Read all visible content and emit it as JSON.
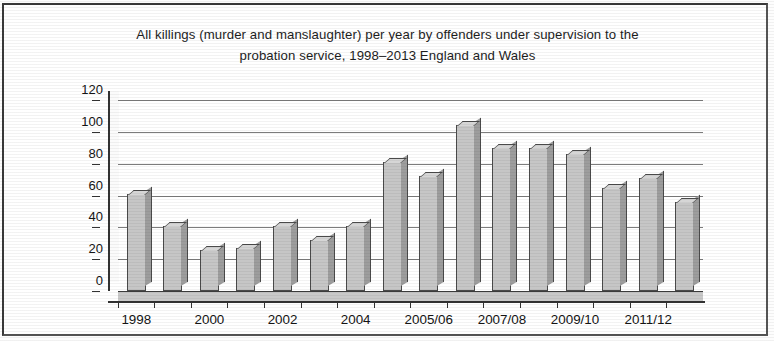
{
  "figure": {
    "title_line1": "All killings (murder and manslaughter) per year by offenders under supervision to the",
    "title_line2": "probation service, 1998–2013 England and Wales"
  },
  "chart_data": {
    "type": "bar",
    "title": "All killings (murder and manslaughter) per year by offenders under supervision to the probation service, 1998–2013 England and Wales",
    "subtitle": "",
    "xlabel": "",
    "ylabel": "",
    "ylim": [
      0,
      120
    ],
    "ytick_labels": [
      "0",
      "20",
      "40",
      "60",
      "80",
      "100",
      "120"
    ],
    "ytick_values": [
      0,
      20,
      40,
      60,
      80,
      100,
      120
    ],
    "grid": true,
    "legend": "none",
    "style": "3d-bar grayscale",
    "categories": [
      "1998",
      "1999",
      "2000",
      "2001",
      "2002",
      "2003",
      "2004",
      "2005/06",
      "2006/07",
      "2007/08",
      "2008/09",
      "2009/10",
      "2010/11",
      "2011/12",
      "2012/13",
      "2013"
    ],
    "xtick_labels_shown": [
      "1998",
      "",
      "2000",
      "",
      "2002",
      "",
      "2004",
      "",
      "2005/06",
      "",
      "2007/08",
      "",
      "2009/10",
      "",
      "2011/12",
      ""
    ],
    "values": [
      61,
      41,
      26,
      27,
      41,
      32,
      41,
      81,
      72,
      104,
      90,
      90,
      86,
      65,
      71,
      56
    ],
    "values_note": "bar heights read from gridlines"
  }
}
